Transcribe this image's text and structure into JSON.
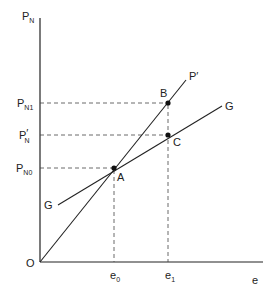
{
  "diagram": {
    "axes": {
      "y_label_main": "P",
      "y_label_sub": "N",
      "x_label": "e",
      "origin_label": "O"
    },
    "y_ticks": [
      {
        "main": "P",
        "sub": "N1",
        "prime": ""
      },
      {
        "main": "P",
        "sub": "N",
        "prime": "′"
      },
      {
        "main": "P",
        "sub": "N0",
        "prime": ""
      }
    ],
    "x_ticks": [
      {
        "main": "e",
        "sub": "0"
      },
      {
        "main": "e",
        "sub": "1"
      }
    ],
    "points": {
      "A": "A",
      "B": "B",
      "C": "C"
    },
    "curves": {
      "p_prime": "P′",
      "g_upper": "G",
      "g_lower": "G"
    },
    "colors": {
      "ink": "#222222",
      "background": "#ffffff"
    }
  }
}
